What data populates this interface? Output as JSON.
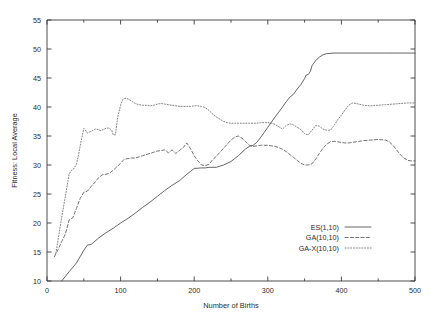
{
  "chart_data": {
    "type": "line",
    "title": "",
    "xlabel": "Number of Births",
    "ylabel": "Fitness: Local Average",
    "xlim": [
      0,
      500
    ],
    "ylim": [
      10,
      55
    ],
    "xticks": [
      0,
      100,
      200,
      300,
      400,
      500
    ],
    "xtick_labels": [
      "0",
      "100",
      "200",
      "300",
      "400",
      "500"
    ],
    "xminor_ticks": [
      50,
      150,
      250,
      350,
      450
    ],
    "yticks": [
      10,
      15,
      20,
      25,
      30,
      35,
      40,
      45,
      50,
      55
    ],
    "ytick_labels": [
      "10",
      "15",
      "20",
      "25",
      "30",
      "35",
      "40",
      "45",
      "50",
      "55"
    ],
    "grid": false,
    "legend_position": "lower right",
    "series": [
      {
        "name": "ES(1,10)",
        "style": "solid",
        "x": [
          20,
          30,
          40,
          50,
          55,
          60,
          70,
          80,
          90,
          100,
          110,
          120,
          130,
          140,
          150,
          160,
          170,
          180,
          190,
          195,
          200,
          210,
          215,
          220,
          230,
          240,
          250,
          255,
          260,
          265,
          270,
          275,
          280,
          285,
          290,
          295,
          300,
          310,
          320,
          325,
          330,
          335,
          340,
          345,
          350,
          352,
          355,
          358,
          360,
          365,
          370,
          375,
          380,
          390,
          400,
          420,
          440,
          460,
          480,
          500
        ],
        "y": [
          10.0,
          11.6,
          13.1,
          15.3,
          16.2,
          16.3,
          17.4,
          18.3,
          19.1,
          20.0,
          20.8,
          21.7,
          22.7,
          23.6,
          24.6,
          25.6,
          26.5,
          27.3,
          28.4,
          28.9,
          29.4,
          29.5,
          29.5,
          29.6,
          29.6,
          30.0,
          30.6,
          31.1,
          31.6,
          32.2,
          32.8,
          33.2,
          33.4,
          33.9,
          34.7,
          35.6,
          36.5,
          38.3,
          40.0,
          40.9,
          41.7,
          42.2,
          43.1,
          43.9,
          44.9,
          45.5,
          45.6,
          46.2,
          47.1,
          48.0,
          48.6,
          49.0,
          49.2,
          49.3,
          49.3,
          49.3,
          49.3,
          49.3,
          49.3,
          49.3
        ]
      },
      {
        "name": "GA(10,10)",
        "style": "dashed",
        "x": [
          10,
          15,
          20,
          25,
          30,
          35,
          40,
          45,
          50,
          55,
          60,
          65,
          70,
          75,
          80,
          85,
          90,
          95,
          100,
          105,
          110,
          115,
          120,
          125,
          130,
          135,
          140,
          145,
          150,
          155,
          160,
          165,
          170,
          175,
          180,
          185,
          190,
          195,
          200,
          205,
          210,
          215,
          220,
          225,
          230,
          235,
          240,
          245,
          250,
          255,
          260,
          265,
          270,
          275,
          280,
          285,
          290,
          295,
          300,
          305,
          310,
          315,
          320,
          325,
          330,
          335,
          340,
          345,
          350,
          355,
          360,
          365,
          370,
          375,
          380,
          385,
          390,
          395,
          400,
          405,
          410,
          415,
          420,
          430,
          440,
          450,
          460,
          465,
          470,
          475,
          480,
          485,
          490,
          495,
          500
        ],
        "y": [
          14.2,
          15.4,
          16.8,
          18.1,
          20.5,
          20.9,
          22.5,
          24.2,
          25.3,
          25.5,
          26.3,
          27.0,
          27.8,
          28.3,
          28.4,
          28.6,
          29.1,
          29.7,
          30.3,
          31.0,
          31.1,
          31.2,
          31.2,
          31.4,
          31.6,
          31.8,
          32.0,
          32.2,
          32.4,
          32.5,
          32.6,
          32.1,
          32.6,
          32.0,
          32.5,
          33.0,
          33.8,
          32.8,
          31.6,
          30.7,
          30.0,
          29.9,
          30.1,
          30.9,
          31.5,
          32.2,
          32.9,
          33.6,
          34.3,
          34.8,
          35.0,
          34.6,
          34.0,
          33.4,
          33.2,
          33.3,
          33.4,
          33.4,
          33.4,
          33.3,
          33.2,
          33.0,
          32.7,
          32.3,
          31.8,
          31.3,
          30.8,
          30.3,
          30.0,
          30.0,
          30.2,
          31.0,
          32.0,
          32.9,
          33.6,
          34.0,
          34.1,
          34.0,
          33.9,
          33.8,
          33.8,
          33.9,
          34.0,
          34.2,
          34.3,
          34.4,
          34.3,
          34.0,
          33.4,
          32.6,
          31.8,
          31.2,
          30.8,
          30.7,
          30.7
        ]
      },
      {
        "name": "GA-X(10,10)",
        "style": "dotted",
        "x": [
          12,
          16,
          20,
          25,
          30,
          33,
          36,
          40,
          43,
          46,
          50,
          52,
          55,
          58,
          60,
          63,
          66,
          70,
          73,
          76,
          80,
          83,
          86,
          88,
          90,
          93,
          96,
          100,
          103,
          106,
          110,
          115,
          120,
          125,
          130,
          135,
          140,
          145,
          150,
          155,
          160,
          165,
          170,
          175,
          180,
          185,
          190,
          195,
          200,
          205,
          210,
          215,
          220,
          225,
          230,
          235,
          240,
          245,
          250,
          255,
          260,
          265,
          270,
          275,
          280,
          285,
          290,
          295,
          300,
          305,
          310,
          315,
          320,
          325,
          330,
          335,
          340,
          345,
          350,
          355,
          360,
          365,
          370,
          375,
          380,
          385,
          390,
          395,
          400,
          405,
          410,
          415,
          420,
          430,
          440,
          450,
          460,
          470,
          480,
          490,
          500
        ],
        "y": [
          14.8,
          17.8,
          21.0,
          24.6,
          28.4,
          29.0,
          29.3,
          30.1,
          31.9,
          33.9,
          36.3,
          36.0,
          35.5,
          35.7,
          35.8,
          36.0,
          36.2,
          36.1,
          35.9,
          36.1,
          36.3,
          36.4,
          36.2,
          36.0,
          35.2,
          35.2,
          38.2,
          40.3,
          41.3,
          41.5,
          41.4,
          41.0,
          40.6,
          40.4,
          40.3,
          40.3,
          40.2,
          40.3,
          40.5,
          40.6,
          40.5,
          40.4,
          40.3,
          40.2,
          40.1,
          40.1,
          40.1,
          40.1,
          40.2,
          40.2,
          40.1,
          39.9,
          39.4,
          38.8,
          38.3,
          37.9,
          37.5,
          37.3,
          37.2,
          37.2,
          37.2,
          37.2,
          37.2,
          37.2,
          37.2,
          37.2,
          37.3,
          37.3,
          37.3,
          37.2,
          37.0,
          36.6,
          36.2,
          36.8,
          37.1,
          36.9,
          36.5,
          36.1,
          35.4,
          35.2,
          36.0,
          36.8,
          36.7,
          36.2,
          36.0,
          36.0,
          36.8,
          37.8,
          38.6,
          39.5,
          40.3,
          40.7,
          40.6,
          40.3,
          40.2,
          40.3,
          40.4,
          40.5,
          40.6,
          40.7,
          40.7
        ]
      }
    ]
  },
  "legend": {
    "entries": [
      {
        "label": "ES(1,10)",
        "style": "solid"
      },
      {
        "label": "GA(10,10)",
        "style": "dashed"
      },
      {
        "label": "GA-X(10,10)",
        "style": "dotted"
      }
    ]
  }
}
